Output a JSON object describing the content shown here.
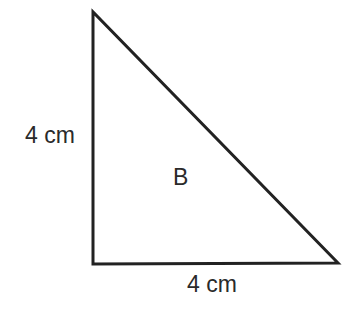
{
  "figure": {
    "shape": "right-triangle",
    "name_label": "B",
    "left_side_label": "4 cm",
    "bottom_side_label": "4 cm",
    "vertices": {
      "apex": [
        93,
        12
      ],
      "right_angle": [
        93,
        264
      ],
      "bottom_right": [
        338,
        263
      ]
    },
    "stroke_color": "#222222",
    "stroke_width": 3
  }
}
